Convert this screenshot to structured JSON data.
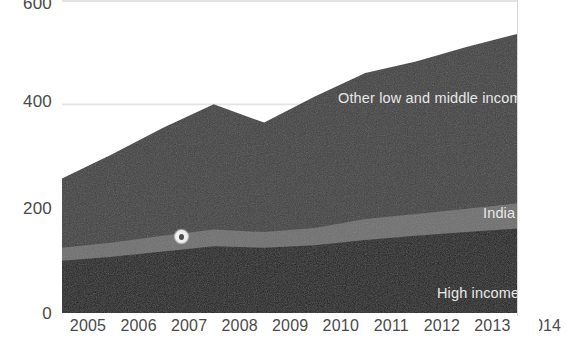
{
  "chart_data": {
    "type": "area",
    "stacked": true,
    "title": "",
    "xlabel": "",
    "ylabel": "",
    "grid": true,
    "legend_position": "inline-right",
    "x": [
      2005,
      2006,
      2007,
      2008,
      2009,
      2010,
      2011,
      2012,
      2013,
      2014
    ],
    "categories": [
      "2005",
      "2006",
      "2007",
      "2008",
      "2009",
      "2010",
      "2011",
      "2012",
      "2013",
      "2014"
    ],
    "xlim": [
      2005,
      2014
    ],
    "ylim": [
      0,
      600
    ],
    "yticks": [
      0,
      200,
      400,
      600
    ],
    "ytick_labels": [
      "0",
      "200",
      "400",
      "600"
    ],
    "series": [
      {
        "name": "High income",
        "color": "#1c1c1c",
        "label_color": "#e8e8e8",
        "values": [
          100,
          108,
          118,
          128,
          125,
          130,
          140,
          148,
          155,
          162
        ]
      },
      {
        "name": "India",
        "color": "#6e6e6e",
        "label_color": "#e8e8e8",
        "values": [
          25,
          27,
          30,
          32,
          30,
          33,
          40,
          42,
          45,
          48
        ]
      },
      {
        "name": "Other low and middle income",
        "color": "#3f3f3f",
        "label_color": "#e8e8e8",
        "values": [
          133,
          170,
          207,
          240,
          210,
          252,
          280,
          292,
          310,
          325
        ]
      }
    ],
    "totals": [
      258,
      305,
      355,
      400,
      365,
      415,
      460,
      482,
      510,
      535
    ],
    "annotations": [
      {
        "name": "pointer-dot",
        "x": 2007.2,
        "y": 148,
        "shape": "circle"
      }
    ]
  },
  "axes": {
    "y_ticks": [
      "600",
      "400",
      "200",
      "0"
    ],
    "x_ticks": [
      "2005",
      "2006",
      "2007",
      "2008",
      "2009",
      "2010",
      "2011",
      "2012",
      "2013",
      "2014"
    ]
  },
  "labels": {
    "other": "Other low and middle income",
    "india": "India",
    "high_income": "High income"
  },
  "colors": {
    "high_income": "#1c1c1c",
    "india": "#6e6e6e",
    "other": "#3f3f3f",
    "gridline": "#e3e3e3",
    "axis_text": "#4a4a4a",
    "label_text": "#e8e8e8",
    "background": "#ffffff"
  }
}
